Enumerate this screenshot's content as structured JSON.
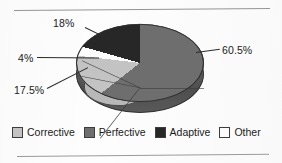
{
  "chart_data": {
    "type": "pie",
    "title": "",
    "subtitle": "",
    "xlabel": "",
    "ylabel": "",
    "grid": false,
    "legend_position": "bottom",
    "three_d": true,
    "categories": [
      "Corrective",
      "Perfective",
      "Adaptive",
      "Other"
    ],
    "values": [
      17.5,
      60.5,
      18,
      4
    ],
    "data_labels": [
      "17.5%",
      "60.5%",
      "18%",
      "4%"
    ],
    "colors": [
      "#c3c3c3",
      "#6e6e6e",
      "#272727",
      "#fbfbfb"
    ],
    "slices": [
      {
        "label": "Perfective",
        "value": 60.5,
        "data_label": "60.5%",
        "color": "#6e6e6e"
      },
      {
        "label": "Corrective",
        "value": 17.5,
        "data_label": "17.5%",
        "color": "#c3c3c3"
      },
      {
        "label": "Other",
        "value": 4,
        "data_label": "4%",
        "color": "#fbfbfb"
      },
      {
        "label": "Adaptive",
        "value": 18,
        "data_label": "18%",
        "color": "#272727"
      }
    ]
  },
  "labels": {
    "adaptive_pct": "18%",
    "perfective_pct": "60.5%",
    "other_pct": "4%",
    "corrective_pct": "17.5%"
  },
  "legend": {
    "items": [
      {
        "label": "Corrective",
        "color": "#c3c3c3"
      },
      {
        "label": "Perfective",
        "color": "#6e6e6e"
      },
      {
        "label": "Adaptive",
        "color": "#272727"
      },
      {
        "label": "Other",
        "color": "#fbfbfb"
      }
    ]
  },
  "style": {
    "rule_color": "#949494",
    "background": "#fdfdfd",
    "text_color": "#1a1a1a"
  }
}
